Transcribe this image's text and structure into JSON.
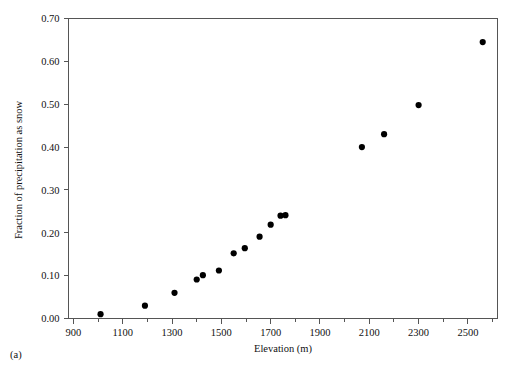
{
  "figure": {
    "panel_label": "(a)",
    "background_color": "#ffffff",
    "axis_color": "#555555",
    "marker_color": "#000000"
  },
  "chart_data": {
    "type": "scatter",
    "title": "",
    "xlabel": "Elevation (m)",
    "ylabel": "Fraction of precipitation as snow",
    "xlim": [
      880,
      2620
    ],
    "ylim": [
      0.0,
      0.7
    ],
    "xticks": [
      900,
      1100,
      1300,
      1500,
      1700,
      1900,
      2100,
      2300,
      2500
    ],
    "xticklabels": [
      "900",
      "1100",
      "1300",
      "1500",
      "1700",
      "1900",
      "2100",
      "2300",
      "2500"
    ],
    "xminor_interval": 100,
    "yticks": [
      0.0,
      0.1,
      0.2,
      0.3,
      0.4,
      0.5,
      0.6,
      0.7
    ],
    "yticklabels": [
      "0.00",
      "0.10",
      "0.20",
      "0.30",
      "0.40",
      "0.50",
      "0.60",
      "0.70"
    ],
    "grid": false,
    "legend": null,
    "marker": "filled-circle",
    "points": [
      {
        "x": 1010,
        "y": 0.01
      },
      {
        "x": 1190,
        "y": 0.03
      },
      {
        "x": 1310,
        "y": 0.06
      },
      {
        "x": 1400,
        "y": 0.091
      },
      {
        "x": 1425,
        "y": 0.101
      },
      {
        "x": 1490,
        "y": 0.112
      },
      {
        "x": 1550,
        "y": 0.152
      },
      {
        "x": 1595,
        "y": 0.164
      },
      {
        "x": 1655,
        "y": 0.191
      },
      {
        "x": 1700,
        "y": 0.219
      },
      {
        "x": 1740,
        "y": 0.24
      },
      {
        "x": 1760,
        "y": 0.241
      },
      {
        "x": 2070,
        "y": 0.4
      },
      {
        "x": 2160,
        "y": 0.43
      },
      {
        "x": 2300,
        "y": 0.498
      },
      {
        "x": 2560,
        "y": 0.645
      }
    ]
  }
}
